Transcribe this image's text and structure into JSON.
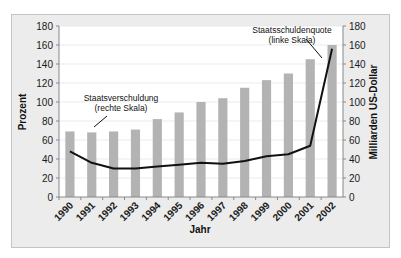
{
  "chart_data": {
    "type": "bar",
    "title": "",
    "categories": [
      "1990",
      "1991",
      "1992",
      "1993",
      "1994",
      "1995",
      "1996",
      "1997",
      "1998",
      "1999",
      "2000",
      "2001",
      "2002"
    ],
    "series": [
      {
        "name": "Staatsschuldenquote (linke Skala)",
        "kind": "bar",
        "axis": "left",
        "color": "#b3b3b3",
        "values": [
          69,
          68,
          69,
          71,
          82,
          89,
          100,
          104,
          115,
          123,
          130,
          145,
          160
        ]
      },
      {
        "name": "Staatsverschuldung (rechte Skala)",
        "kind": "line",
        "axis": "right",
        "color": "#111111",
        "values": [
          48,
          36,
          30,
          30,
          32,
          34,
          36,
          35,
          38,
          43,
          45,
          54,
          156
        ]
      }
    ],
    "xlabel": "Jahr",
    "ylabel": "Prozent",
    "ylabel_right": "Milliarden US-Dollar",
    "ylim": [
      0,
      180
    ],
    "ylim_right": [
      0,
      180
    ],
    "yticks": [
      0,
      20,
      40,
      60,
      80,
      100,
      120,
      140,
      160,
      180
    ],
    "grid": true,
    "legend_position": "annotations",
    "annotations": [
      {
        "line1": "Staatsverschuldung",
        "line2": "(rechte Skala)",
        "target": "line"
      },
      {
        "line1": "Staatsschuldenquote",
        "line2": "(linke Skala)",
        "target": "bars"
      }
    ]
  },
  "labels": {
    "xlabel": "Jahr",
    "ylabel": "Prozent",
    "ylabel_right": "Milliarden US-Dollar",
    "annot_line_1": "Staatsverschuldung",
    "annot_line_2": "(rechte Skala)",
    "annot_bar_1": "Staatsschuldenquote",
    "annot_bar_2": "(linke Skala)"
  }
}
